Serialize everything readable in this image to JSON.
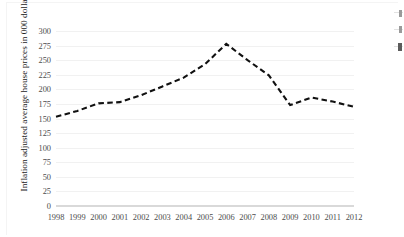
{
  "chart_data": {
    "type": "line",
    "title": "",
    "subtitle": "",
    "xlabel": "",
    "ylabel": "Inflation adjusted average house prices in 000 dollars",
    "categories": [
      "1998",
      "1999",
      "2000",
      "2001",
      "2002",
      "2003",
      "2004",
      "2005",
      "2006",
      "2007",
      "2008",
      "2009",
      "2010",
      "2011",
      "2012"
    ],
    "values": [
      153,
      163,
      176,
      178,
      190,
      205,
      220,
      243,
      278,
      250,
      224,
      173,
      186,
      179,
      170
    ],
    "series": [
      {
        "name": "Inflation adjusted average house prices",
        "values": [
          153,
          163,
          176,
          178,
          190,
          205,
          220,
          243,
          278,
          250,
          224,
          173,
          186,
          179,
          170
        ]
      }
    ],
    "xlim": [
      "1998",
      "2012"
    ],
    "ylim": [
      0,
      300
    ],
    "y_ticks": [
      0,
      25,
      50,
      75,
      100,
      125,
      150,
      175,
      200,
      225,
      250,
      275,
      300
    ],
    "y_tick_labels": [
      "0",
      "25",
      "50",
      "75",
      "100",
      "125",
      "150",
      "175",
      "200",
      "225",
      "250",
      "275",
      "300"
    ],
    "x_tick_labels": [
      "1998",
      "1999",
      "2000",
      "2001",
      "2002",
      "2003",
      "2004",
      "2005",
      "2006",
      "2007",
      "2008",
      "2009",
      "2010",
      "2011",
      "2012"
    ],
    "grid": true,
    "grid_axis": "y",
    "legend": false,
    "legend_position": "none",
    "line_style": "dashed",
    "line_color": "#111111",
    "line_width": 2.1,
    "markers": "none",
    "annotations": []
  },
  "style": {
    "background_color": "#ffffff",
    "gridline_color": "#f1f1f1",
    "axis_color": "#d9d9d9",
    "tick_label_color": "#4d4d4d",
    "axis_title_color": "#1a1a1a"
  },
  "edge_artifacts": {
    "description": "clipped-legend-marks",
    "count": 3
  }
}
